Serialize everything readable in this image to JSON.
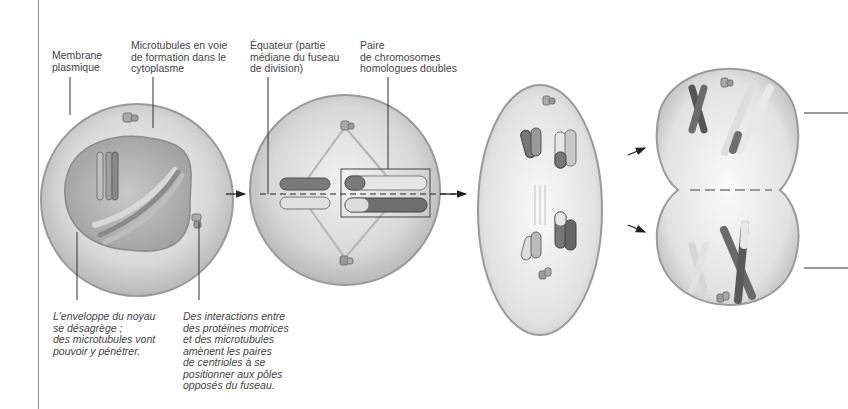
{
  "figure": {
    "labels": {
      "membrane": "Membrane\nplasmique",
      "microtubules": "Microtubules en voie\nde formation dans le\ncytoplasme",
      "equateur": "Équateur (partie\nmédiane du fuseau\nde division)",
      "paire": "Paire\nde chromosomes\nhomologues doubles"
    },
    "captions": {
      "enveloppe": "L'enveloppe du noyau\nse désagrège ;\ndes microtubules vont\npouvoir y pénétrer.",
      "interactions": "Des interactions entre\ndes protéines motrices\net des microtubules\namènent les paires\nde centrioles à se\npositionner aux pôles\nopposés du fuseau."
    },
    "stages": [
      {
        "name": "prophase-I-cell"
      },
      {
        "name": "metaphase-I-cell"
      },
      {
        "name": "anaphase-I-cell"
      },
      {
        "name": "telophase-I-cytokinesis-cell"
      }
    ],
    "colors": {
      "cell_fill": "#d9d9d9",
      "cell_edge": "#9a9a9a",
      "chromosome_dark": "#6f6f6f",
      "chromosome_light": "#e6e6e6",
      "leader_line": "#333333"
    }
  }
}
